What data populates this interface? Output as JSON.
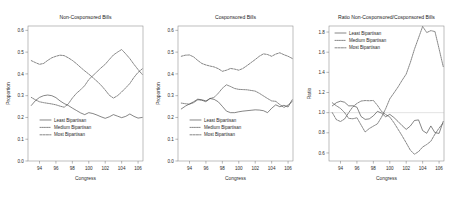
{
  "figure": {
    "background": "#ffffff",
    "series_color": "#3a3a3a",
    "panel_count": 3
  },
  "legend": {
    "least": "Least Bipartisan",
    "medium": "Medium Bipartisan",
    "most": "Most Bipartisan"
  },
  "panels": [
    {
      "id": "non-cosponsored",
      "title": "Non-Cosponsored Bills",
      "xlabel": "Congress",
      "ylabel": "Proportion",
      "legend_position": "bottom-left"
    },
    {
      "id": "cosponsored",
      "title": "Cosponsored Bills",
      "xlabel": "Congress",
      "ylabel": "Proportion",
      "legend_position": "bottom-left"
    },
    {
      "id": "ratio",
      "title": "Ratio Non-Cosponsored/Cosponsored Bills",
      "xlabel": "Congress",
      "ylabel": "Ratio",
      "legend_position": "top-left"
    }
  ],
  "chart_data": [
    {
      "type": "line",
      "title": "Non-Cosponsored Bills",
      "xlabel": "Congress",
      "ylabel": "Proportion",
      "xlim": [
        92.6,
        106.6
      ],
      "ylim": [
        0.0,
        0.62
      ],
      "xticks": [
        94,
        96,
        98,
        100,
        102,
        104,
        106
      ],
      "yticks": [
        0.0,
        0.1,
        0.2,
        0.3,
        0.4,
        0.5,
        0.6
      ],
      "grid": false,
      "legend": [
        "Least Bipartisan",
        "Medium Bipartisan",
        "Most Bipartisan"
      ],
      "x": [
        93,
        93.5,
        94,
        94.5,
        95,
        95.5,
        96,
        96.5,
        97,
        97.5,
        98,
        98.5,
        99,
        99.5,
        100,
        100.5,
        101,
        101.5,
        102,
        102.5,
        103,
        103.5,
        104,
        104.5,
        105,
        105.5,
        106,
        106.5
      ],
      "series": [
        {
          "name": "Least Bipartisan",
          "style": "solid",
          "values": [
            0.255,
            0.277,
            0.292,
            0.3,
            0.303,
            0.3,
            0.291,
            0.276,
            0.264,
            0.255,
            0.243,
            0.232,
            0.221,
            0.213,
            0.222,
            0.218,
            0.211,
            0.203,
            0.196,
            0.203,
            0.213,
            0.206,
            0.199,
            0.205,
            0.216,
            0.205,
            0.197,
            0.2
          ]
        },
        {
          "name": "Medium Bipartisan",
          "style": "dotted",
          "values": [
            0.292,
            0.281,
            0.272,
            0.268,
            0.265,
            0.262,
            0.258,
            0.252,
            0.247,
            0.262,
            0.289,
            0.311,
            0.327,
            0.346,
            0.374,
            0.392,
            0.41,
            0.428,
            0.444,
            0.466,
            0.487,
            0.5,
            0.512,
            0.492,
            0.47,
            0.444,
            0.42,
            0.398
          ]
        },
        {
          "name": "Most Bipartisan",
          "style": "dashed",
          "values": [
            0.461,
            0.452,
            0.444,
            0.448,
            0.462,
            0.474,
            0.481,
            0.486,
            0.484,
            0.474,
            0.462,
            0.447,
            0.43,
            0.414,
            0.399,
            0.383,
            0.366,
            0.348,
            0.326,
            0.302,
            0.289,
            0.3,
            0.317,
            0.336,
            0.356,
            0.384,
            0.407,
            0.423
          ]
        }
      ]
    },
    {
      "type": "line",
      "title": "Cosponsored Bills",
      "xlabel": "Congress",
      "ylabel": "Proportion",
      "xlim": [
        92.6,
        106.6
      ],
      "ylim": [
        0.0,
        0.62
      ],
      "xticks": [
        94,
        96,
        98,
        100,
        102,
        104,
        106
      ],
      "yticks": [
        0.0,
        0.1,
        0.2,
        0.3,
        0.4,
        0.5,
        0.6
      ],
      "grid": false,
      "legend": [
        "Least Bipartisan",
        "Medium Bipartisan",
        "Most Bipartisan"
      ],
      "x": [
        93,
        93.5,
        94,
        94.5,
        95,
        95.5,
        96,
        96.5,
        97,
        97.5,
        98,
        98.5,
        99,
        99.5,
        100,
        100.5,
        101,
        101.5,
        102,
        102.5,
        103,
        103.5,
        104,
        104.5,
        105,
        105.5,
        106,
        106.5
      ],
      "series": [
        {
          "name": "Least Bipartisan",
          "style": "solid",
          "values": [
            0.239,
            0.252,
            0.262,
            0.272,
            0.284,
            0.281,
            0.276,
            0.287,
            0.283,
            0.272,
            0.251,
            0.229,
            0.222,
            0.222,
            0.226,
            0.229,
            0.231,
            0.233,
            0.235,
            0.234,
            0.231,
            0.222,
            0.242,
            0.258,
            0.249,
            0.256,
            0.248,
            0.281
          ]
        },
        {
          "name": "Medium Bipartisan",
          "style": "dotted",
          "values": [
            0.266,
            0.263,
            0.261,
            0.268,
            0.281,
            0.279,
            0.272,
            0.287,
            0.292,
            0.311,
            0.334,
            0.35,
            0.342,
            0.333,
            0.329,
            0.328,
            0.327,
            0.324,
            0.321,
            0.311,
            0.299,
            0.287,
            0.276,
            0.274,
            0.259,
            0.246,
            0.257,
            0.273
          ]
        },
        {
          "name": "Most Bipartisan",
          "style": "dashed",
          "values": [
            0.481,
            0.486,
            0.487,
            0.478,
            0.462,
            0.448,
            0.441,
            0.436,
            0.432,
            0.424,
            0.412,
            0.417,
            0.425,
            0.422,
            0.417,
            0.425,
            0.438,
            0.452,
            0.466,
            0.481,
            0.492,
            0.489,
            0.481,
            0.491,
            0.497,
            0.488,
            0.481,
            0.471
          ]
        }
      ]
    },
    {
      "type": "line",
      "title": "Ratio Non-Cosponsored/Cosponsored Bills",
      "xlabel": "Congress",
      "ylabel": "Ratio",
      "xlim": [
        92.6,
        106.6
      ],
      "ylim": [
        0.52,
        1.86
      ],
      "xticks": [
        94,
        96,
        98,
        100,
        102,
        104,
        106
      ],
      "yticks": [
        0.6,
        0.8,
        1.0,
        1.2,
        1.4,
        1.6,
        1.8
      ],
      "grid": false,
      "reference_line": 1.0,
      "legend": [
        "Least Bipartisan",
        "Medium Bipartisan",
        "Most Bipartisan"
      ],
      "x": [
        93,
        93.5,
        94,
        94.5,
        95,
        95.5,
        96,
        96.5,
        97,
        97.5,
        98,
        98.5,
        99,
        99.5,
        100,
        100.5,
        101,
        101.5,
        102,
        102.5,
        103,
        103.5,
        104,
        104.5,
        105,
        105.5,
        106,
        106.5
      ],
      "series": [
        {
          "name": "Least Bipartisan",
          "style": "solid",
          "values": [
            1.067,
            1.099,
            1.114,
            1.103,
            1.067,
            1.068,
            1.054,
            0.962,
            0.933,
            0.938,
            0.968,
            1.013,
            0.995,
            0.959,
            0.983,
            0.952,
            0.913,
            0.871,
            0.834,
            0.867,
            0.922,
            0.928,
            0.822,
            0.795,
            0.868,
            0.801,
            0.794,
            0.912
          ]
        },
        {
          "name": "Medium Bipartisan",
          "style": "dotted",
          "values": [
            1.098,
            1.068,
            1.042,
            1.0,
            0.943,
            0.939,
            0.949,
            0.878,
            0.808,
            0.842,
            0.866,
            0.889,
            0.956,
            1.039,
            1.137,
            1.195,
            1.254,
            1.321,
            1.383,
            1.497,
            1.629,
            1.742,
            1.855,
            1.795,
            1.814,
            1.805,
            1.634,
            1.458
          ]
        },
        {
          "name": "Most Bipartisan",
          "style": "dashed",
          "values": [
            1.0,
            0.93,
            0.912,
            0.937,
            1.0,
            1.058,
            1.091,
            1.115,
            1.12,
            1.118,
            1.121,
            1.072,
            1.012,
            0.981,
            0.957,
            0.901,
            0.836,
            0.77,
            0.7,
            0.628,
            0.587,
            0.613,
            0.659,
            0.684,
            0.716,
            0.787,
            0.846,
            0.898
          ]
        }
      ]
    }
  ]
}
